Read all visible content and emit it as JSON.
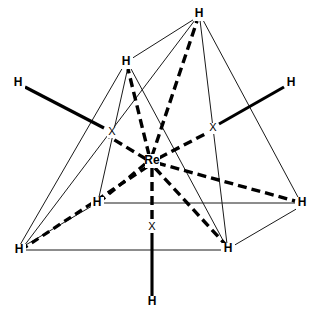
{
  "diagram": {
    "type": "chemical-structure",
    "width": 317,
    "height": 321,
    "background_color": "#ffffff",
    "line_color": "#000000",
    "thin_line_color": "#1a1a1a"
  },
  "center_atom": {
    "label": "Re",
    "x": 152,
    "y": 161
  },
  "hydrogen_atoms": [
    {
      "id": "h-top",
      "label": "H",
      "x": 199,
      "y": 14
    },
    {
      "id": "h-upper-left",
      "label": "H",
      "x": 126,
      "y": 62
    },
    {
      "id": "h-left",
      "label": "H",
      "x": 18,
      "y": 83
    },
    {
      "id": "h-right",
      "label": "H",
      "x": 291,
      "y": 83
    },
    {
      "id": "h-mid-left",
      "label": "H",
      "x": 97,
      "y": 203
    },
    {
      "id": "h-mid-right",
      "label": "H",
      "x": 302,
      "y": 203
    },
    {
      "id": "h-bottom-left",
      "label": "H",
      "x": 19,
      "y": 250
    },
    {
      "id": "h-bottom-inner",
      "label": "H",
      "x": 228,
      "y": 249
    },
    {
      "id": "h-bottom",
      "label": "H",
      "x": 152,
      "y": 302
    }
  ],
  "axis_markers": [
    {
      "id": "x-left",
      "label": "X",
      "x": 112,
      "y": 132
    },
    {
      "id": "x-right",
      "label": "X",
      "x": 213,
      "y": 128
    },
    {
      "id": "x-bottom",
      "label": "X",
      "x": 152,
      "y": 227
    }
  ],
  "legend": {
    "solid_bond": "solid bond",
    "dashed_bond": "dashed bond",
    "thin_edge": "polyhedron edge"
  }
}
